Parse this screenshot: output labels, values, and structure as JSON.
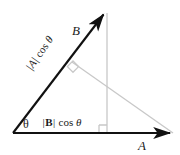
{
  "figure": {
    "width": 180,
    "height": 155,
    "background_color": "#ffffff"
  },
  "colors": {
    "vector_stroke": "#111111",
    "construction_stroke": "#c8c8c8",
    "text": "#1a1a1a"
  },
  "labels": {
    "vector_b": "B",
    "vector_a": "A",
    "angle": "θ",
    "projection_on_a_prefix": "|",
    "projection_on_a_vector": "B",
    "projection_on_a_suffix": "|",
    "projection_on_a_function": "cos",
    "projection_on_a_angle": "θ",
    "projection_on_b_prefix": "|",
    "projection_on_b_vector": "A",
    "projection_on_b_suffix": "|",
    "projection_on_b_function": "cos",
    "projection_on_b_angle": "θ"
  },
  "geometry": {
    "origin": {
      "x": 13,
      "y": 133
    },
    "vector_a_tip": {
      "x": 173,
      "y": 133
    },
    "vector_b_tip": {
      "x": 106,
      "y": 11
    },
    "vertical_drop_x": 107,
    "vertical_drop_top_y": 13,
    "vertical_drop_bottom_y": 133,
    "perpendicular_foot": {
      "x": 72,
      "y": 62
    },
    "right_angle_marker_base": {
      "x": 99,
      "y": 125,
      "size": 8
    },
    "right_angle_marker_upper": {
      "x": 72,
      "y": 62,
      "size": 8
    }
  },
  "icons": {
    "arrowhead": "arrowhead-icon",
    "right-angle": "right-angle-marker-icon"
  }
}
